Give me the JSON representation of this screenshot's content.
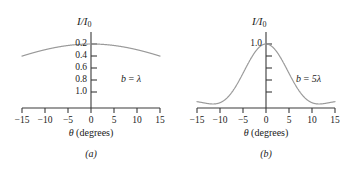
{
  "figure": {
    "background_color": "#ffffff",
    "curve_color": "#9a9a9a",
    "axis_color": "#3a3a3a",
    "text_color": "#1a1a1a"
  },
  "chart_data": [
    {
      "type": "line",
      "panel": "a",
      "caption": "(a)",
      "title": "",
      "xlabel": "θ (degrees)",
      "ylabel": "I/I₀",
      "annotation": "b = λ",
      "slit_width_label": "b = λ",
      "slit_width_in_wavelengths": 1,
      "xlim": [
        -15,
        15
      ],
      "ylim": [
        0,
        1.0
      ],
      "xticks": [
        -15,
        -10,
        -5,
        0,
        5,
        10,
        15
      ],
      "xticklabels": [
        "−15",
        "−10",
        "−5",
        "0",
        "5",
        "10",
        "15"
      ],
      "yticks": [
        0.2,
        0.4,
        0.6,
        0.8,
        1.0
      ],
      "yticklabels": [
        "0.2",
        "0.4",
        "0.6",
        "0.8",
        "1.0"
      ],
      "grid": false,
      "legend": "none",
      "x": [
        -15,
        -13,
        -11,
        -9,
        -7,
        -5,
        -3,
        -1,
        0,
        1,
        3,
        5,
        7,
        9,
        11,
        13,
        15
      ],
      "values": [
        0.824,
        0.866,
        0.903,
        0.934,
        0.96,
        0.979,
        0.992,
        0.999,
        1.0,
        0.999,
        0.992,
        0.979,
        0.96,
        0.934,
        0.903,
        0.866,
        0.824
      ]
    },
    {
      "type": "line",
      "panel": "b",
      "caption": "(b)",
      "title": "",
      "xlabel": "θ (degrees)",
      "ylabel": "I/I₀",
      "annotation": "b = 5λ",
      "slit_width_label": "b = 5λ",
      "slit_width_in_wavelengths": 5,
      "xlim": [
        -15,
        15
      ],
      "ylim": [
        0,
        1.0
      ],
      "xticks": [
        -15,
        -10,
        -5,
        0,
        5,
        10,
        15
      ],
      "xticklabels": [
        "−15",
        "−10",
        "−5",
        "0",
        "5",
        "10",
        "15"
      ],
      "yticks": [
        0.2,
        0.4,
        0.6,
        0.8,
        1.0
      ],
      "yticklabels": [
        "1.0"
      ],
      "grid": false,
      "legend": "none",
      "x": [
        -15,
        -13,
        -11.54,
        -10,
        -8,
        -6,
        -4,
        -2,
        0,
        2,
        4,
        6,
        8,
        10,
        11.54,
        13,
        15
      ],
      "values": [
        0.031,
        0.013,
        0.0,
        0.031,
        0.245,
        0.572,
        0.843,
        0.962,
        1.0,
        0.962,
        0.843,
        0.572,
        0.245,
        0.031,
        0.0,
        0.013,
        0.031
      ]
    }
  ]
}
